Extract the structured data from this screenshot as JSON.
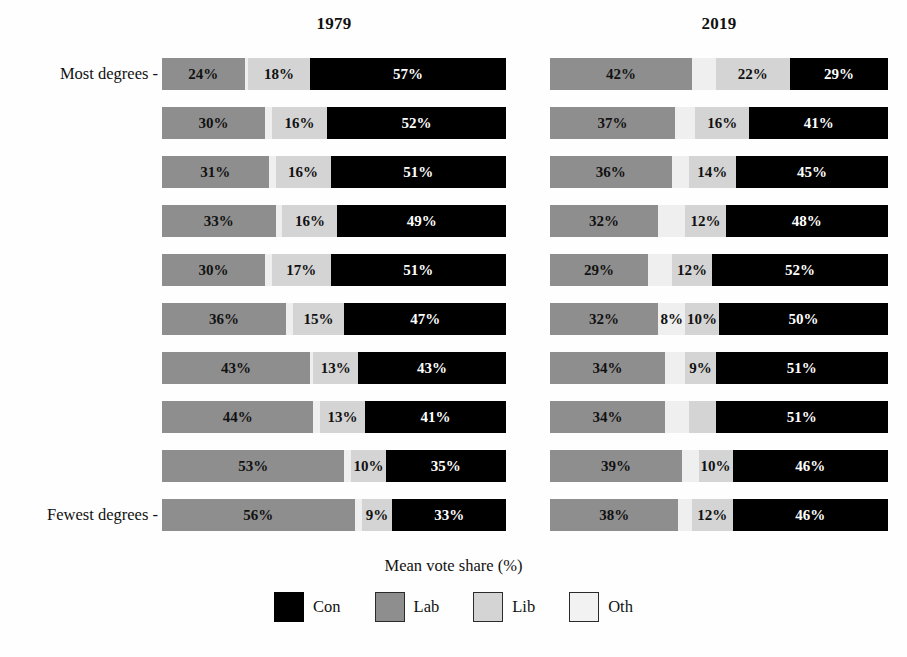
{
  "axis": {
    "x_title": "Mean vote share (%)",
    "top_category_label": "Most degrees -",
    "bottom_category_label": "Fewest degrees -"
  },
  "panels": [
    {
      "title": "1979"
    },
    {
      "title": "2019"
    }
  ],
  "legend": {
    "items": [
      {
        "key": "con",
        "label": "Con",
        "color": "#000000"
      },
      {
        "key": "lab",
        "label": "Lab",
        "color": "#8e8e8e"
      },
      {
        "key": "lib",
        "label": "Lib",
        "color": "#d4d4d4"
      },
      {
        "key": "oth",
        "label": "Oth",
        "color": "#f2f2f2"
      }
    ]
  },
  "chart_data": {
    "type": "bar",
    "subtype": "stacked-horizontal",
    "title": "",
    "xlabel": "Mean vote share (%)",
    "ylabel": "",
    "xlim": [
      0,
      100
    ],
    "grid": false,
    "legend_position": "bottom",
    "panel_titles": [
      "1979",
      "2019"
    ],
    "categories": [
      "Most degrees",
      "decile 2",
      "decile 3",
      "decile 4",
      "decile 5",
      "decile 6",
      "decile 7",
      "decile 8",
      "decile 9",
      "Fewest degrees"
    ],
    "series_order": [
      "lab",
      "oth",
      "lib",
      "con"
    ],
    "series_labels": {
      "lab": "Lab",
      "oth": "Oth",
      "lib": "Lib",
      "con": "Con"
    },
    "panels": [
      {
        "title": "1979",
        "rows": [
          {
            "category": "Most degrees",
            "lab": 24,
            "oth": 1,
            "lib": 18,
            "con": 57,
            "labels": {
              "lab": "24%",
              "oth": "",
              "lib": "18%",
              "con": "57%"
            }
          },
          {
            "category": "decile 2",
            "lab": 30,
            "oth": 2,
            "lib": 16,
            "con": 52,
            "labels": {
              "lab": "30%",
              "oth": "",
              "lib": "16%",
              "con": "52%"
            }
          },
          {
            "category": "decile 3",
            "lab": 31,
            "oth": 2,
            "lib": 16,
            "con": 51,
            "labels": {
              "lab": "31%",
              "oth": "",
              "lib": "16%",
              "con": "51%"
            }
          },
          {
            "category": "decile 4",
            "lab": 33,
            "oth": 2,
            "lib": 16,
            "con": 49,
            "labels": {
              "lab": "33%",
              "oth": "",
              "lib": "16%",
              "con": "49%"
            }
          },
          {
            "category": "decile 5",
            "lab": 30,
            "oth": 2,
            "lib": 17,
            "con": 51,
            "labels": {
              "lab": "30%",
              "oth": "",
              "lib": "17%",
              "con": "51%"
            }
          },
          {
            "category": "decile 6",
            "lab": 36,
            "oth": 2,
            "lib": 15,
            "con": 47,
            "labels": {
              "lab": "36%",
              "oth": "",
              "lib": "15%",
              "con": "47%"
            }
          },
          {
            "category": "decile 7",
            "lab": 43,
            "oth": 1,
            "lib": 13,
            "con": 43,
            "labels": {
              "lab": "43%",
              "oth": "",
              "lib": "13%",
              "con": "43%"
            }
          },
          {
            "category": "decile 8",
            "lab": 44,
            "oth": 2,
            "lib": 13,
            "con": 41,
            "labels": {
              "lab": "44%",
              "oth": "",
              "lib": "13%",
              "con": "41%"
            }
          },
          {
            "category": "decile 9",
            "lab": 53,
            "oth": 2,
            "lib": 10,
            "con": 35,
            "labels": {
              "lab": "53%",
              "oth": "",
              "lib": "10%",
              "con": "35%"
            }
          },
          {
            "category": "Fewest degrees",
            "lab": 56,
            "oth": 2,
            "lib": 9,
            "con": 33,
            "labels": {
              "lab": "56%",
              "oth": "",
              "lib": "9%",
              "con": "33%"
            }
          }
        ]
      },
      {
        "title": "2019",
        "rows": [
          {
            "category": "Most degrees",
            "lab": 42,
            "oth": 7,
            "lib": 22,
            "con": 29,
            "labels": {
              "lab": "42%",
              "oth": "",
              "lib": "22%",
              "con": "29%"
            }
          },
          {
            "category": "decile 2",
            "lab": 37,
            "oth": 6,
            "lib": 16,
            "con": 41,
            "labels": {
              "lab": "37%",
              "oth": "",
              "lib": "16%",
              "con": "41%"
            }
          },
          {
            "category": "decile 3",
            "lab": 36,
            "oth": 5,
            "lib": 14,
            "con": 45,
            "labels": {
              "lab": "36%",
              "oth": "",
              "lib": "14%",
              "con": "45%"
            }
          },
          {
            "category": "decile 4",
            "lab": 32,
            "oth": 8,
            "lib": 12,
            "con": 48,
            "labels": {
              "lab": "32%",
              "oth": "",
              "lib": "12%",
              "con": "48%"
            }
          },
          {
            "category": "decile 5",
            "lab": 29,
            "oth": 7,
            "lib": 12,
            "con": 52,
            "labels": {
              "lab": "29%",
              "oth": "",
              "lib": "12%",
              "con": "52%"
            }
          },
          {
            "category": "decile 6",
            "lab": 32,
            "oth": 8,
            "lib": 10,
            "con": 50,
            "labels": {
              "lab": "32%",
              "oth": "8%",
              "lib": "10%",
              "con": "50%"
            }
          },
          {
            "category": "decile 7",
            "lab": 34,
            "oth": 6,
            "lib": 9,
            "con": 51,
            "labels": {
              "lab": "34%",
              "oth": "",
              "lib": "9%",
              "con": "51%"
            }
          },
          {
            "category": "decile 8",
            "lab": 34,
            "oth": 7,
            "lib": 8,
            "con": 51,
            "labels": {
              "lab": "34%",
              "oth": "",
              "lib": "",
              "con": "51%"
            }
          },
          {
            "category": "decile 9",
            "lab": 39,
            "oth": 5,
            "lib": 10,
            "con": 46,
            "labels": {
              "lab": "39%",
              "oth": "",
              "lib": "10%",
              "con": "46%"
            }
          },
          {
            "category": "Fewest degrees",
            "lab": 38,
            "oth": 4,
            "lib": 12,
            "con": 46,
            "labels": {
              "lab": "38%",
              "oth": "",
              "lib": "12%",
              "con": "46%"
            }
          }
        ]
      }
    ]
  }
}
